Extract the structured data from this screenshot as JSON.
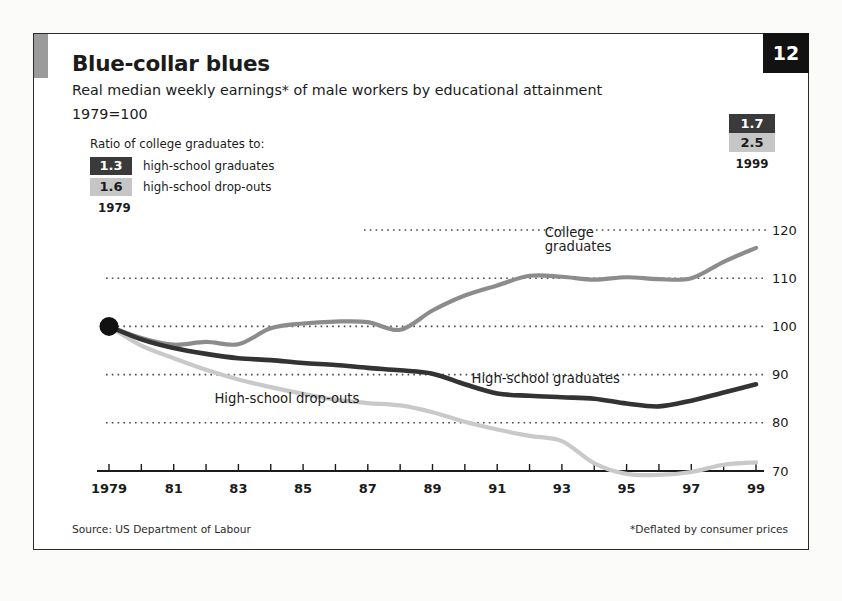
{
  "header": {
    "title": "Blue-collar blues",
    "subtitle": "Real median weekly earnings* of male workers by educational attainment",
    "baseline": "1979=100",
    "page_number": "12"
  },
  "legend": {
    "title": "Ratio of college graduates to:",
    "rows": [
      {
        "value": "1.3",
        "label": "high-school graduates",
        "style": "dark"
      },
      {
        "value": "1.6",
        "label": "high-school drop-outs",
        "style": "light"
      }
    ],
    "year": "1979"
  },
  "ratio_right": {
    "values": [
      {
        "value": "1.7",
        "style": "dark"
      },
      {
        "value": "2.5",
        "style": "light"
      }
    ],
    "year": "1999"
  },
  "footer": {
    "source": "Source: US Department of Labour",
    "footnote": "*Deflated by consumer prices"
  },
  "colors": {
    "college": "#8c8c8c",
    "hs_graduates": "#333333",
    "hs_dropouts": "#c9c9c9",
    "grid": "#4a4a4a",
    "axis": "#1b1b1b",
    "panel_tab": "#9b9b9b",
    "page_box": "#121212"
  },
  "chart_data": {
    "type": "line",
    "title": "Blue-collar blues",
    "subtitle": "Real median weekly earnings* of male workers by educational attainment",
    "xlabel": "",
    "ylabel": "1979=100",
    "grid": true,
    "legend_position": "in-plot",
    "x": [
      1979,
      1980,
      1981,
      1982,
      1983,
      1984,
      1985,
      1986,
      1987,
      1988,
      1989,
      1990,
      1991,
      1992,
      1993,
      1994,
      1995,
      1996,
      1997,
      1998,
      1999
    ],
    "xtick_labels": [
      "1979",
      "",
      "81",
      "",
      "83",
      "",
      "85",
      "",
      "87",
      "",
      "89",
      "",
      "91",
      "",
      "93",
      "",
      "95",
      "",
      "97",
      "",
      "99"
    ],
    "ytick_labels": [
      "70",
      "80",
      "90",
      "100",
      "110",
      "120"
    ],
    "ylim": [
      67,
      123
    ],
    "xlim": [
      1979,
      1999
    ],
    "annotations": [
      {
        "text": "College graduates",
        "series": "College graduates",
        "x": 1993.5,
        "y": 115
      },
      {
        "text": "High-school graduates",
        "series": "High-school graduates",
        "x": 1992.5,
        "y": 89
      },
      {
        "text": "High-school drop-outs",
        "series": "High-school drop-outs",
        "x": 1984.5,
        "y": 85
      }
    ],
    "marker_points": [
      {
        "x": 1979,
        "y": 100,
        "label": "1979=100"
      }
    ],
    "series": [
      {
        "name": "College graduates",
        "color": "#8c8c8c",
        "values": [
          100,
          97.6,
          96.2,
          96.8,
          96.3,
          99.6,
          100.6,
          101.0,
          100.9,
          99.3,
          103.3,
          106.4,
          108.5,
          110.5,
          110.3,
          109.7,
          110.2,
          109.8,
          110.0,
          113.4,
          116.3
        ]
      },
      {
        "name": "High-school graduates",
        "color": "#333333",
        "values": [
          100,
          97.3,
          95.5,
          94.3,
          93.4,
          93.0,
          92.4,
          92.0,
          91.4,
          90.9,
          90.2,
          88.0,
          86.1,
          85.6,
          85.3,
          85.0,
          84.0,
          83.4,
          84.6,
          86.3,
          88.0
        ]
      },
      {
        "name": "High-school drop-outs",
        "color": "#c9c9c9",
        "values": [
          100,
          96.0,
          93.4,
          91.0,
          89.0,
          87.4,
          86.0,
          84.8,
          84.1,
          83.6,
          82.2,
          80.2,
          78.6,
          77.3,
          76.2,
          71.6,
          69.4,
          69.2,
          69.8,
          71.3,
          71.8
        ]
      }
    ]
  }
}
